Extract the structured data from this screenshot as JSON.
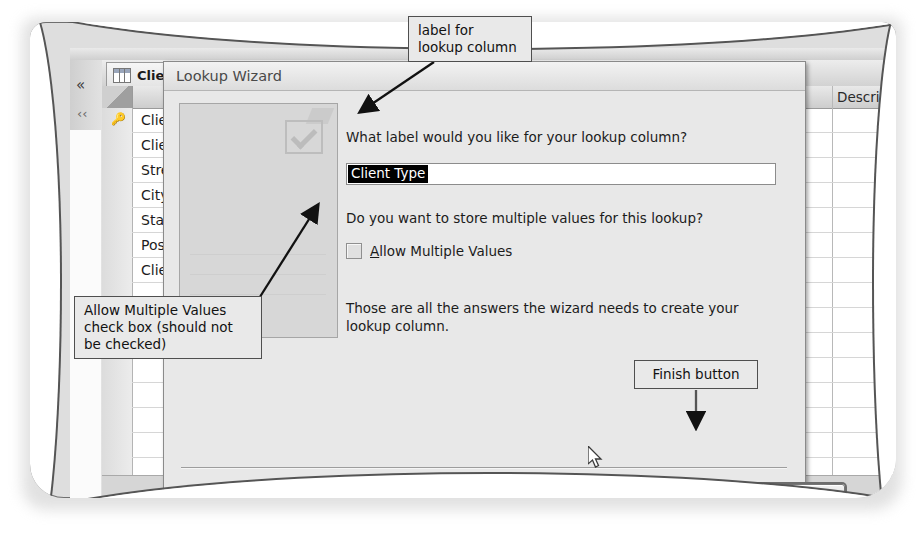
{
  "access": {
    "shutter_icon": "double-chevron-left",
    "tab_label": "Clien",
    "table_icon": "table-grid-icon",
    "key_icon": "primary-key-icon",
    "description_header": "Description",
    "field_rows": [
      "Clien",
      "Clien",
      "Stree",
      "City",
      "State",
      "Posta",
      "Clien"
    ]
  },
  "dialog": {
    "title": "Lookup Wizard",
    "preview_icon": "checkmark-preview-icon",
    "question_label": "What label would you like for your lookup column?",
    "label_value": "Client Type",
    "question_multi": "Do you want to store multiple values for this lookup?",
    "checkbox_label_prefix": "A",
    "checkbox_label_rest": "llow Multiple Values",
    "checkbox_checked": false,
    "closing_text": "Those are all the answers the wizard needs to create your lookup column.",
    "buttons": {
      "cancel": "Cancel",
      "back_prefix": "< ",
      "back_accel": "B",
      "back_rest": "ack",
      "next_accel": "N",
      "next_rest": "ext >",
      "next_disabled": true,
      "finish_accel": "F",
      "finish_rest": "inish",
      "finish_default": true
    }
  },
  "annotations": {
    "label_callout": "label for\nlookup column",
    "allow_callout": "Allow Multiple Values check box (should not be checked)",
    "finish_callout": "Finish button"
  },
  "colors": {
    "page": "#dedede",
    "dialog": "#e8e8e8",
    "selection": "#000000",
    "outline": "#4f4f4f"
  }
}
